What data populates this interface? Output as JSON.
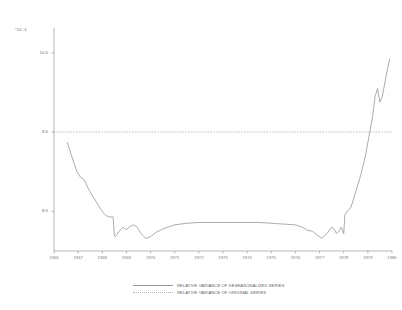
{
  "chart_data": {
    "type": "line",
    "title": "",
    "xlabel": "",
    "ylabel": "",
    "scale_note": "*10 -4",
    "ylim": [
      8.0,
      10.75
    ],
    "yticks": [
      8.5,
      9.5,
      10.5
    ],
    "ytick_labels": [
      "8.5",
      "9.5",
      "10.5"
    ],
    "xlim": [
      1966,
      1980
    ],
    "xticks": [
      1966,
      1967,
      1968,
      1969,
      1970,
      1971,
      1972,
      1973,
      1974,
      1975,
      1976,
      1977,
      1978,
      1979,
      1980
    ],
    "xtick_labels": [
      "1966",
      "1967",
      "1968",
      "1969",
      "1970",
      "1971",
      "1972",
      "1973",
      "1974",
      "1975",
      "1976",
      "1977",
      "1978",
      "1979",
      "1980"
    ],
    "grid": false,
    "legend_position": "bottom",
    "series": [
      {
        "name": "RELATIVE VARIANCE OF DESEASONALIZED SERIES",
        "style": "solid",
        "color": "#8a8a8a",
        "x": [
          1966.55,
          1966.75,
          1966.95,
          1967.1,
          1967.25,
          1967.4,
          1967.55,
          1967.75,
          1967.95,
          1968.1,
          1968.2,
          1968.3,
          1968.45,
          1968.5,
          1968.55,
          1968.7,
          1968.85,
          1969.0,
          1969.15,
          1969.3,
          1969.45,
          1969.6,
          1969.8,
          1970.0,
          1970.2,
          1970.45,
          1970.7,
          1971.0,
          1971.5,
          1972.0,
          1972.5,
          1973.0,
          1973.5,
          1974.0,
          1974.5,
          1975.0,
          1975.5,
          1976.0,
          1976.3,
          1976.5,
          1976.7,
          1976.9,
          1977.1,
          1977.3,
          1977.5,
          1977.6,
          1977.7,
          1977.8,
          1977.9,
          1978.0,
          1978.05,
          1978.15,
          1978.3,
          1978.5,
          1978.7,
          1978.9,
          1979.05,
          1979.2,
          1979.3,
          1979.4,
          1979.5,
          1979.6,
          1979.75,
          1979.9
        ],
        "y": [
          9.37,
          9.18,
          9.0,
          8.93,
          8.9,
          8.8,
          8.72,
          8.62,
          8.52,
          8.46,
          8.44,
          8.43,
          8.43,
          8.19,
          8.18,
          8.25,
          8.3,
          8.27,
          8.31,
          8.33,
          8.3,
          8.22,
          8.16,
          8.18,
          8.23,
          8.27,
          8.3,
          8.33,
          8.35,
          8.36,
          8.36,
          8.36,
          8.36,
          8.36,
          8.36,
          8.35,
          8.34,
          8.33,
          8.3,
          8.26,
          8.25,
          8.2,
          8.16,
          8.22,
          8.3,
          8.28,
          8.22,
          8.25,
          8.3,
          8.22,
          8.46,
          8.5,
          8.55,
          8.75,
          8.95,
          9.2,
          9.45,
          9.7,
          9.95,
          10.05,
          9.88,
          9.95,
          10.2,
          10.42
        ]
      },
      {
        "name": "RELATIVE VARIANCE OF ORIGINAL SERIES",
        "style": "dotted",
        "color": "#b5b5b5",
        "x": [
          1966.0,
          1980.0
        ],
        "y": [
          9.5,
          9.5
        ]
      }
    ]
  },
  "legend": {
    "items": [
      {
        "label": "RELATIVE VARIANCE OF DESEASONALIZED SERIES",
        "style": "solid"
      },
      {
        "label": "RELATIVE VARIANCE OF ORIGINAL SERIES",
        "style": "dotted"
      }
    ]
  }
}
